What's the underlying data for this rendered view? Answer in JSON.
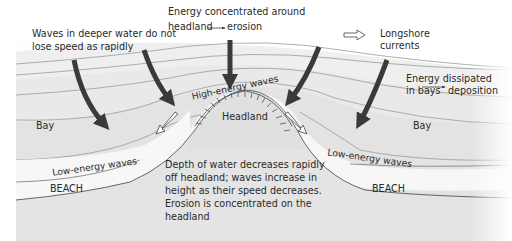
{
  "diagram": {
    "colors": {
      "background": "#ffffff",
      "sea_top": "#f4f4f4",
      "sea_mid": "#ebebeb",
      "sea_near": "#e3e3e3",
      "headland": "#dcdcdc",
      "beach": "#f7f7f7",
      "land": "#e4e4e4",
      "contour": "#9a9a9a",
      "arrow": "#3a3a3a",
      "text": "#2a2a2a"
    },
    "annotations": {
      "deep_water_line1": "Waves in deeper water do not",
      "deep_water_line2": "lose speed as rapidly",
      "energy_conc_line1": "Energy concentrated around",
      "energy_conc_line2_a": "headland",
      "energy_conc_line2_b": "erosion",
      "longshore_line1": "Longshore",
      "longshore_line2": "currents",
      "dissipated_line1": "Energy dissipated",
      "dissipated_line2_a": "in bays",
      "dissipated_line2_b": "deposition",
      "high_energy": "High-energy waves",
      "headland": "Headland",
      "bay_left": "Bay",
      "bay_right": "Bay",
      "low_energy_left": "Low-energy waves",
      "low_energy_right": "Low-energy waves",
      "beach_left": "BEACH",
      "beach_right": "BEACH",
      "depth_line1": "Depth of water decreases rapidly",
      "depth_line2": "off headland; waves increase in",
      "depth_line3": "height as their speed decreases.",
      "depth_line4": "Erosion is concentrated on the",
      "depth_line5": "headland"
    },
    "legend": {
      "icon": "hollow-arrow-icon",
      "label_line1": "Longshore",
      "label_line2": "currents"
    },
    "icons": {
      "wave_direction": "wave-direction-arrow-icon",
      "longshore": "hollow-arrow-icon",
      "leads_to": "small-right-arrow-icon",
      "cliff_hachures": "cliff-hachure-icon"
    }
  }
}
